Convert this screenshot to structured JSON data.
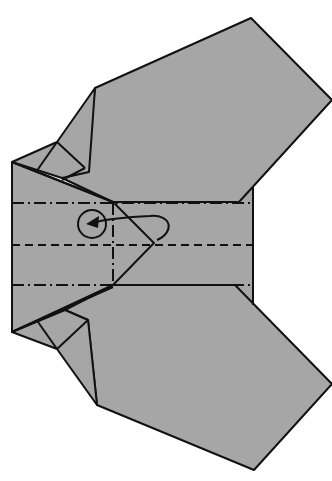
{
  "diagram": {
    "type": "origami-step",
    "colors": {
      "paper": "#a6a6a6",
      "line": "#111111",
      "background": "#ffffff"
    },
    "symbols": {
      "valley_fold": "dashed-line",
      "mountain_fold": "dash-dot-line",
      "turn_over_arrow": "looped-arrow-with-circle"
    },
    "fold_lines": [
      {
        "kind": "mountain",
        "orientation": "horizontal",
        "y": 203
      },
      {
        "kind": "valley",
        "orientation": "horizontal",
        "y": 243
      },
      {
        "kind": "mountain",
        "orientation": "horizontal",
        "y": 285
      },
      {
        "kind": "mountain",
        "orientation": "vertical",
        "x": 113
      }
    ]
  }
}
